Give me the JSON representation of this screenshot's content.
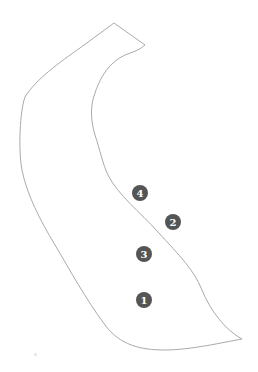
{
  "map": {
    "outline_color": "#aaaaaa",
    "marker_fill": "#555555",
    "marker_text_color": "#ffffff",
    "markers": [
      {
        "label": "1",
        "cx": 144,
        "cy": 300
      },
      {
        "label": "2",
        "cx": 173,
        "cy": 222
      },
      {
        "label": "3",
        "cx": 144,
        "cy": 254
      },
      {
        "label": "4",
        "cx": 140,
        "cy": 193
      }
    ]
  }
}
